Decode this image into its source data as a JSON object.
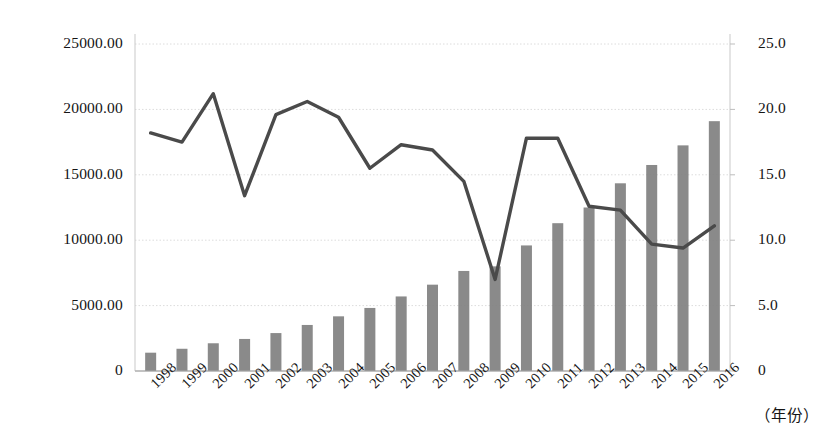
{
  "chart_data": {
    "type": "bar",
    "title": "",
    "subtitle": "",
    "xlabel": "（年份）",
    "ylabel": "",
    "y2label": "",
    "grid": true,
    "legend": "none",
    "categories": [
      "1998",
      "1999",
      "2000",
      "2001",
      "2002",
      "2003",
      "2004",
      "2005",
      "2006",
      "2007",
      "2008",
      "2009",
      "2010",
      "2011",
      "2012",
      "2013",
      "2014",
      "2015",
      "2016"
    ],
    "ylim": [
      0,
      25000
    ],
    "y2lim": [
      0,
      25
    ],
    "yticks": [
      "0",
      "5000.00",
      "10000.00",
      "15000.00",
      "20000.00",
      "25000.00"
    ],
    "ytick_values": [
      0,
      5000,
      10000,
      15000,
      20000,
      25000
    ],
    "y2ticks": [
      "0",
      "5.0",
      "10.0",
      "15.0",
      "20.0",
      "25.0"
    ],
    "y2tick_values": [
      0,
      5,
      10,
      15,
      20,
      25
    ],
    "series": [
      {
        "name": "bars",
        "kind": "bar",
        "axis": "left",
        "color": "#808080",
        "values": [
          1400,
          1700,
          2120,
          2450,
          2900,
          3520,
          4180,
          4820,
          5700,
          6600,
          7650,
          8000,
          9600,
          11300,
          12500,
          14350,
          15750,
          17250,
          19100
        ]
      },
      {
        "name": "line",
        "kind": "line",
        "axis": "right",
        "color": "#4a4a4a",
        "values": [
          18.2,
          17.5,
          21.2,
          13.4,
          19.6,
          20.6,
          19.4,
          15.5,
          17.3,
          16.9,
          14.5,
          7.0,
          17.8,
          17.8,
          12.6,
          12.3,
          9.7,
          9.4,
          11.1
        ]
      }
    ]
  },
  "plot_geometry": {
    "left": 135,
    "right": 730,
    "top": 44,
    "bottom": 371
  }
}
